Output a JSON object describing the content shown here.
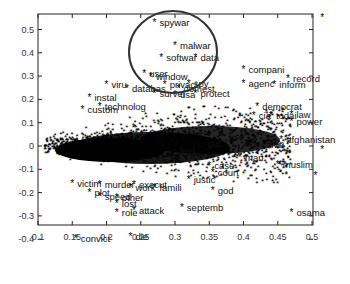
{
  "chart_data": {
    "type": "scatter",
    "title": "",
    "xlabel": "",
    "ylabel": "",
    "xlim": [
      0.1,
      0.52
    ],
    "ylim": [
      -0.45,
      0.55
    ],
    "x_ticks": [
      "0.1",
      "0.15",
      "0.2",
      "0.25",
      "0.3",
      "0.35",
      "0.4",
      "0.45",
      "0.5"
    ],
    "y_ticks": [
      "0.5",
      "0.4",
      "0.3",
      "0.2",
      "0.1",
      "0",
      "-0.1",
      "-0.2",
      "-0.3",
      "-0.4"
    ],
    "grid": false,
    "marker": "*",
    "annotation": {
      "type": "circle",
      "center": [
        0.295,
        0.41
      ],
      "note": "cluster of security-related terms highlighted"
    },
    "points": [
      {
        "label": "spywar",
        "x": 0.27,
        "y": 0.53
      },
      {
        "label": "malwar",
        "x": 0.3,
        "y": 0.43
      },
      {
        "label": "softwar",
        "x": 0.28,
        "y": 0.38
      },
      {
        "label": "data",
        "x": 0.33,
        "y": 0.38
      },
      {
        "label": "compani",
        "x": 0.4,
        "y": 0.33
      },
      {
        "label": "record",
        "x": 0.465,
        "y": 0.29
      },
      {
        "label": "agenc",
        "x": 0.4,
        "y": 0.27
      },
      {
        "label": "inform",
        "x": 0.445,
        "y": 0.265
      },
      {
        "label": "user",
        "x": 0.255,
        "y": 0.31
      },
      {
        "label": "window",
        "x": 0.265,
        "y": 0.3
      },
      {
        "label": "viru",
        "x": 0.2,
        "y": 0.265
      },
      {
        "label": "privaci",
        "x": 0.285,
        "y": 0.265
      },
      {
        "label": "spy",
        "x": 0.32,
        "y": 0.27
      },
      {
        "label": "databas",
        "x": 0.23,
        "y": 0.245
      },
      {
        "label": "domest",
        "x": 0.305,
        "y": 0.245
      },
      {
        "label": "instal",
        "x": 0.175,
        "y": 0.21
      },
      {
        "label": "survei",
        "x": 0.27,
        "y": 0.225
      },
      {
        "label": "usa",
        "x": 0.3,
        "y": 0.22
      },
      {
        "label": "protect",
        "x": 0.33,
        "y": 0.225
      },
      {
        "label": "custom",
        "x": 0.165,
        "y": 0.155
      },
      {
        "label": "technolog",
        "x": 0.19,
        "y": 0.17
      },
      {
        "label": "democrat",
        "x": 0.42,
        "y": 0.17
      },
      {
        "label": "cia",
        "x": 0.415,
        "y": 0.13
      },
      {
        "label": "todai",
        "x": 0.44,
        "y": 0.13
      },
      {
        "label": "law",
        "x": 0.47,
        "y": 0.135
      },
      {
        "label": "power",
        "x": 0.47,
        "y": 0.105
      },
      {
        "label": "afghanistan",
        "x": 0.455,
        "y": 0.03
      },
      {
        "label": "person",
        "x": 0.41,
        "y": 0.01
      },
      {
        "label": "live",
        "x": 0.43,
        "y": 0.005
      },
      {
        "label": "gul",
        "x": 0.34,
        "y": 0.01
      },
      {
        "label": "feel",
        "x": 0.3,
        "y": -0.02
      },
      {
        "label": "man",
        "x": 0.395,
        "y": -0.05
      },
      {
        "label": "case",
        "x": 0.35,
        "y": -0.085
      },
      {
        "label": "muslim",
        "x": 0.45,
        "y": -0.08
      },
      {
        "label": "court",
        "x": 0.355,
        "y": -0.115
      },
      {
        "label": "justic",
        "x": 0.32,
        "y": -0.145
      },
      {
        "label": "god",
        "x": 0.355,
        "y": -0.19
      },
      {
        "label": "septemb",
        "x": 0.31,
        "y": -0.265
      },
      {
        "label": "osama",
        "x": 0.47,
        "y": -0.285
      },
      {
        "label": "victim",
        "x": 0.15,
        "y": -0.16
      },
      {
        "label": "murder",
        "x": 0.19,
        "y": -0.165
      },
      {
        "label": "execut",
        "x": 0.24,
        "y": -0.165
      },
      {
        "label": "work",
        "x": 0.235,
        "y": -0.18
      },
      {
        "label": "famili",
        "x": 0.27,
        "y": -0.18
      },
      {
        "label": "plot",
        "x": 0.175,
        "y": -0.2
      },
      {
        "label": "speed",
        "x": 0.19,
        "y": -0.215
      },
      {
        "label": "other",
        "x": 0.215,
        "y": -0.22
      },
      {
        "label": "lost",
        "x": 0.215,
        "y": -0.245
      },
      {
        "label": "attack",
        "x": 0.24,
        "y": -0.275
      },
      {
        "label": "role",
        "x": 0.215,
        "y": -0.285
      },
      {
        "label": "convict",
        "x": 0.155,
        "y": -0.395
      },
      {
        "label": "die",
        "x": 0.235,
        "y": -0.39
      },
      {
        "label": "",
        "x": 0.515,
        "y": 0.55
      },
      {
        "label": "",
        "x": 0.515,
        "y": -0.015
      },
      {
        "label": "",
        "x": 0.505,
        "y": -0.125
      }
    ]
  }
}
